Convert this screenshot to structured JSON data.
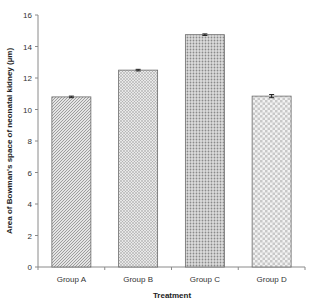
{
  "chart_data": {
    "type": "bar",
    "title": "",
    "xlabel": "Treatment",
    "ylabel": "Area of Bowman's space of neonatal kidney (µm)",
    "categories": [
      "Group A",
      "Group B",
      "Group C",
      "Group D"
    ],
    "values": [
      10.8,
      12.5,
      14.75,
      10.85
    ],
    "error": [
      0.05,
      0.05,
      0.05,
      0.1
    ],
    "ylim": [
      0,
      16
    ],
    "yticks": [
      0,
      2,
      4,
      6,
      8,
      10,
      12,
      14,
      16
    ],
    "ytick_labels": [
      "0",
      "2",
      "4",
      "6",
      "8",
      "10",
      "12",
      "14",
      "16"
    ],
    "grid": false,
    "legend": null,
    "fill_patterns": [
      "diagonal-hatch",
      "dotted-stipple",
      "dense-dots",
      "checker-grid"
    ]
  }
}
